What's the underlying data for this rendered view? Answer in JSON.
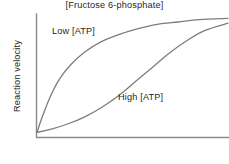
{
  "figure": {
    "background_color": "#ffffff",
    "axis_color": "#8a8a8a",
    "curve_color": "#7d7d7d",
    "text_color": "#1f1f1f"
  },
  "chart_data": {
    "type": "line",
    "title": "",
    "subtitle": "",
    "xlabel": "[Fructose 6-phosphate]",
    "ylabel": "Reaction velocity",
    "grid": false,
    "legend_position": "inline-annotations",
    "axis_ticks": {
      "x": [],
      "y": []
    },
    "xlim": [
      0,
      1
    ],
    "ylim": [
      0,
      1
    ],
    "annotations": [
      {
        "name": "low-atp-label",
        "text": "Low [ATP]",
        "x": 0.09,
        "y": 0.89
      },
      {
        "name": "high-atp-label",
        "text": "High [ATP]",
        "x": 0.43,
        "y": 0.36
      }
    ],
    "series": [
      {
        "name": "Low [ATP]",
        "shape": "hyperbolic",
        "label": "Low [ATP]",
        "color": "#7d7d7d",
        "x": [
          0.0,
          0.03,
          0.07,
          0.12,
          0.18,
          0.25,
          0.33,
          0.42,
          0.52,
          0.63,
          0.74,
          0.85,
          1.0
        ],
        "y": [
          0.03,
          0.17,
          0.33,
          0.48,
          0.6,
          0.7,
          0.78,
          0.84,
          0.89,
          0.93,
          0.95,
          0.97,
          0.98
        ]
      },
      {
        "name": "High [ATP]",
        "shape": "sigmoidal",
        "label": "High [ATP]",
        "color": "#7d7d7d",
        "x": [
          0.0,
          0.08,
          0.16,
          0.25,
          0.34,
          0.43,
          0.52,
          0.61,
          0.7,
          0.79,
          0.88,
          1.0
        ],
        "y": [
          0.03,
          0.06,
          0.1,
          0.16,
          0.24,
          0.34,
          0.46,
          0.58,
          0.7,
          0.8,
          0.88,
          0.94
        ]
      }
    ]
  },
  "axes": {
    "y_axis_label": "Reaction velocity",
    "x_axis_label": "[Fructose 6-phosphate]"
  },
  "labels": {
    "low_atp": "Low [ATP]",
    "high_atp": "High [ATP]"
  }
}
